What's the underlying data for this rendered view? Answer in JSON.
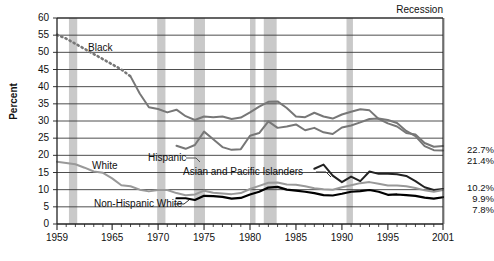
{
  "chart_data": {
    "type": "line",
    "title": "",
    "xlabel": "",
    "ylabel": "Percent",
    "xlim": [
      1959,
      2001
    ],
    "ylim": [
      0,
      60
    ],
    "ytick_step": 5,
    "grid": true,
    "legend": "inline-labels",
    "xticks": [
      "1959",
      "1965",
      "1970",
      "1975",
      "1980",
      "1985",
      "1990",
      "1995",
      "2001"
    ],
    "xtick_values": [
      1959,
      1965,
      1970,
      1975,
      1980,
      1985,
      1990,
      1995,
      2001
    ],
    "yticks": [
      "0",
      "5",
      "10",
      "15",
      "20",
      "25",
      "30",
      "35",
      "40",
      "45",
      "50",
      "55",
      "60"
    ],
    "ytick_values": [
      0,
      5,
      10,
      15,
      20,
      25,
      30,
      35,
      40,
      45,
      50,
      55,
      60
    ],
    "recession_label": "Recession",
    "recession_bands": [
      {
        "start": 1960.3,
        "end": 1961.2
      },
      {
        "start": 1969.9,
        "end": 1970.8
      },
      {
        "start": 1973.9,
        "end": 1975.1
      },
      {
        "start": 1980.0,
        "end": 1980.6
      },
      {
        "start": 1981.5,
        "end": 1982.9
      },
      {
        "start": 1990.5,
        "end": 1991.2
      },
      {
        "start": 2001.0,
        "end": 2001.9
      }
    ],
    "series": [
      {
        "name": "Black",
        "label": "Black",
        "color": "#777777",
        "width": 2.0,
        "end_value": "22.7%",
        "dashed_until": 1966,
        "x": [
          1959,
          1960,
          1961,
          1962,
          1963,
          1964,
          1965,
          1966,
          1967,
          1968,
          1969,
          1970,
          1971,
          1972,
          1973,
          1974,
          1975,
          1976,
          1977,
          1978,
          1979,
          1980,
          1981,
          1982,
          1983,
          1984,
          1985,
          1986,
          1987,
          1988,
          1989,
          1990,
          1991,
          1992,
          1993,
          1994,
          1995,
          1996,
          1997,
          1998,
          1999,
          2000,
          2001
        ],
        "y": [
          55.1,
          54.0,
          52.5,
          51.0,
          49.5,
          48.0,
          46.5,
          45.0,
          43.0,
          38.0,
          34.0,
          33.5,
          32.5,
          33.3,
          31.4,
          30.3,
          31.3,
          31.1,
          31.3,
          30.6,
          31.0,
          32.5,
          34.2,
          35.6,
          35.7,
          33.8,
          31.3,
          31.1,
          32.4,
          31.3,
          30.7,
          31.9,
          32.7,
          33.4,
          33.1,
          30.6,
          29.3,
          28.4,
          26.5,
          26.1,
          23.6,
          22.5,
          22.7
        ]
      },
      {
        "name": "Hispanic",
        "label": "Hispanic",
        "color": "#777777",
        "width": 2.0,
        "end_value": "21.4%",
        "x": [
          1972,
          1973,
          1974,
          1975,
          1976,
          1977,
          1978,
          1979,
          1980,
          1981,
          1982,
          1983,
          1984,
          1985,
          1986,
          1987,
          1988,
          1989,
          1990,
          1991,
          1992,
          1993,
          1994,
          1995,
          1996,
          1997,
          1998,
          1999,
          2000,
          2001
        ],
        "y": [
          22.8,
          21.9,
          23.0,
          26.9,
          24.7,
          22.4,
          21.6,
          21.8,
          25.7,
          26.5,
          29.9,
          28.0,
          28.4,
          29.0,
          27.3,
          28.0,
          26.7,
          26.2,
          28.1,
          28.7,
          29.6,
          30.6,
          30.7,
          30.3,
          29.4,
          27.1,
          25.6,
          22.7,
          21.5,
          21.4
        ]
      },
      {
        "name": "Asian and Pacific Islanders",
        "label": "Asian and Pacific Islanders",
        "color": "#222222",
        "width": 2.0,
        "end_value": "10.2%",
        "x": [
          1987,
          1988,
          1989,
          1990,
          1991,
          1992,
          1993,
          1994,
          1995,
          1996,
          1997,
          1998,
          1999,
          2000,
          2001
        ],
        "y": [
          16.1,
          17.3,
          14.1,
          12.2,
          13.8,
          12.5,
          15.3,
          14.6,
          14.6,
          14.5,
          14.0,
          12.5,
          10.7,
          9.9,
          10.2
        ]
      },
      {
        "name": "White",
        "label": "White",
        "color": "#999999",
        "width": 2.0,
        "end_value": "9.9%",
        "x": [
          1959,
          1960,
          1961,
          1962,
          1963,
          1964,
          1965,
          1966,
          1967,
          1968,
          1969,
          1970,
          1971,
          1972,
          1973,
          1974,
          1975,
          1976,
          1977,
          1978,
          1979,
          1980,
          1981,
          1982,
          1983,
          1984,
          1985,
          1986,
          1987,
          1988,
          1989,
          1990,
          1991,
          1992,
          1993,
          1994,
          1995,
          1996,
          1997,
          1998,
          1999,
          2000,
          2001
        ],
        "y": [
          18.1,
          17.8,
          17.4,
          16.4,
          15.3,
          14.9,
          13.3,
          11.3,
          11.0,
          10.0,
          9.5,
          9.9,
          9.9,
          9.0,
          8.4,
          8.6,
          9.7,
          9.1,
          8.9,
          8.7,
          9.0,
          10.2,
          11.1,
          12.0,
          12.1,
          11.5,
          11.4,
          11.0,
          10.4,
          10.1,
          10.0,
          10.7,
          11.3,
          11.9,
          12.2,
          11.7,
          11.2,
          11.2,
          11.0,
          10.5,
          9.8,
          9.4,
          9.9
        ]
      },
      {
        "name": "Non-Hispanic White",
        "label": "Non-Hispanic White",
        "color": "#000000",
        "width": 2.2,
        "end_value": "7.8%",
        "x": [
          1972,
          1973,
          1974,
          1975,
          1976,
          1977,
          1978,
          1979,
          1980,
          1981,
          1982,
          1983,
          1984,
          1985,
          1986,
          1987,
          1988,
          1989,
          1990,
          1991,
          1992,
          1993,
          1994,
          1995,
          1996,
          1997,
          1998,
          1999,
          2000,
          2001
        ],
        "y": [
          7.5,
          7.5,
          7.0,
          8.2,
          8.1,
          7.9,
          7.4,
          7.6,
          8.6,
          9.4,
          10.6,
          10.8,
          10.0,
          9.7,
          9.4,
          9.0,
          8.4,
          8.3,
          8.8,
          9.4,
          9.6,
          9.9,
          9.4,
          8.5,
          8.6,
          8.4,
          8.2,
          7.7,
          7.4,
          7.8
        ]
      }
    ]
  },
  "plot": {
    "left": 57,
    "right": 443,
    "top": 18,
    "bottom": 224
  }
}
